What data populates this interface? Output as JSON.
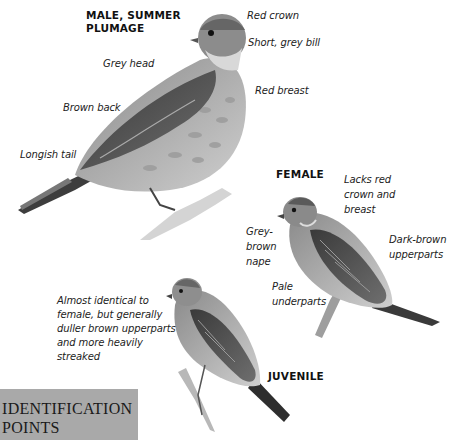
{
  "figure": {
    "colors": {
      "background": "#ffffff",
      "text": "#222222",
      "id_box": "#a9a9a9"
    },
    "male": {
      "heading_line1": "MALE, SUMMER",
      "heading_line2": "PLUMAGE",
      "labels": {
        "red_crown": "Red crown",
        "bill": "Short, grey bill",
        "grey_head": "Grey head",
        "red_breast": "Red breast",
        "brown_back": "Brown back",
        "tail": "Longish tail"
      }
    },
    "female": {
      "heading": "FEMALE",
      "labels": {
        "lacks_line1": "Lacks red",
        "lacks_line2": "crown and",
        "lacks_line3": "breast",
        "nape_line1": "Grey-",
        "nape_line2": "brown",
        "nape_line3": "nape",
        "upper_line1": "Dark-brown",
        "upper_line2": "upperparts",
        "under_line1": "Pale",
        "under_line2": "underparts"
      }
    },
    "juvenile": {
      "heading": "JUVENILE",
      "description_lines": [
        "Almost identical to",
        "female, but generally",
        "duller brown upperparts",
        "and more heavily",
        "streaked"
      ]
    },
    "section_box": {
      "title_line1": "IDENTIFICATION",
      "title_line2": "POINTS"
    }
  }
}
